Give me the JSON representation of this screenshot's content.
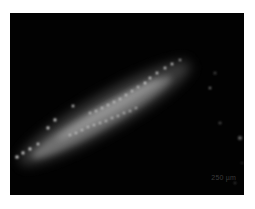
{
  "image": {
    "description": "Fluorescence microscopy image of an elongated glowing specimen on black background",
    "background_color": "#020202",
    "page_color": "#ffffff",
    "specimen_color": "#e8e8e8"
  },
  "scale_bar": {
    "label": "250 µm"
  }
}
